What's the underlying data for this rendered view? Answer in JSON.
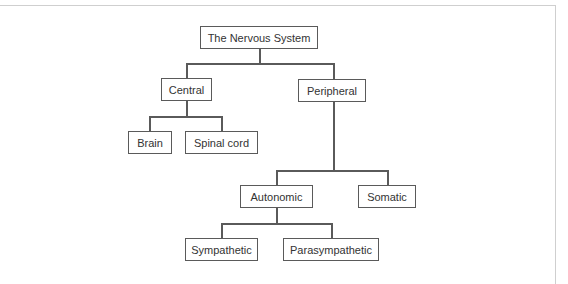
{
  "diagram": {
    "type": "tree",
    "title": "The Nervous System",
    "nodes": {
      "root": "The Nervous System",
      "central": "Central",
      "peripheral": "Peripheral",
      "brain": "Brain",
      "spinal_cord": "Spinal cord",
      "autonomic": "Autonomic",
      "somatic": "Somatic",
      "sympathetic": "Sympathetic",
      "parasympathetic": "Parasympathetic"
    },
    "edges": [
      [
        "The Nervous System",
        "Central"
      ],
      [
        "The Nervous System",
        "Peripheral"
      ],
      [
        "Central",
        "Brain"
      ],
      [
        "Central",
        "Spinal cord"
      ],
      [
        "Peripheral",
        "Autonomic"
      ],
      [
        "Peripheral",
        "Somatic"
      ],
      [
        "Autonomic",
        "Sympathetic"
      ],
      [
        "Autonomic",
        "Parasympathetic"
      ]
    ],
    "colors": {
      "stroke": "#5a5a5a",
      "text": "#333333",
      "frame": "#cfcfcf"
    }
  }
}
